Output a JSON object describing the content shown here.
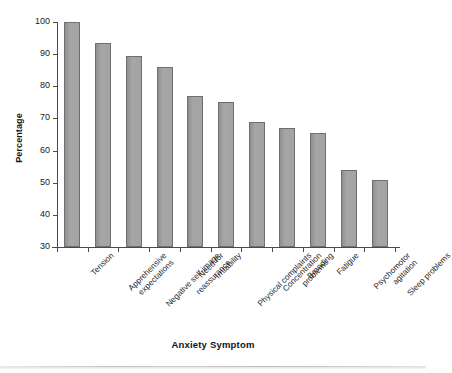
{
  "chart_data": {
    "type": "bar",
    "title": "",
    "xlabel": "Anxiety Symptom",
    "ylabel": "Percentage",
    "ylim": [
      30,
      100
    ],
    "yticks": [
      30,
      40,
      50,
      60,
      70,
      80,
      90,
      100
    ],
    "grid": false,
    "legend": null,
    "bar_color": "#9c9c9c",
    "bar_edge_color": "#6f6f6f",
    "categories": [
      "Tension",
      "Apprehensive expectations",
      "Negative self-image",
      "Need for reassurance",
      "Irritability",
      "Physical complaints",
      "Concentration problems",
      "Brooding",
      "Fatigue",
      "Psychomotor agitation",
      "Sleep problems"
    ],
    "category_lines": [
      [
        "Tension"
      ],
      [
        "Apprehensive",
        "expectations"
      ],
      [
        "Negative self-image"
      ],
      [
        "Need for",
        "reassurance"
      ],
      [
        "Irritability"
      ],
      [
        "Physical complaints"
      ],
      [
        "Concentration",
        "problems"
      ],
      [
        "Brooding"
      ],
      [
        "Fatigue"
      ],
      [
        "Psychomotor",
        "agitation"
      ],
      [
        "Sleep problems"
      ]
    ],
    "values": [
      100,
      93.5,
      89.5,
      86,
      77,
      75,
      69,
      67,
      65.5,
      54,
      51
    ]
  }
}
